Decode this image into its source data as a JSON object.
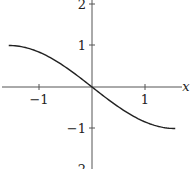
{
  "chart_data": {
    "type": "line",
    "title": "",
    "xlabel": "x",
    "ylabel": "",
    "xlim": [
      -1.75,
      1.85
    ],
    "ylim": [
      -2.0,
      2.05
    ],
    "grid": false,
    "legend": null,
    "x_ticks": [
      -1,
      1
    ],
    "x_tick_labels": [
      "−1",
      "1"
    ],
    "y_ticks": [
      2,
      1,
      -1,
      -2
    ],
    "y_tick_labels": [
      "2",
      "1",
      "−1",
      "−2"
    ],
    "series": [
      {
        "name": "y = -sin(x)",
        "x": [
          -1.5708,
          -1.2,
          -0.8,
          -0.4,
          0,
          0.4,
          0.8,
          1.2,
          1.5708
        ],
        "y": [
          1.0,
          0.932,
          0.717,
          0.389,
          0,
          -0.389,
          -0.717,
          -0.932,
          -1.0
        ]
      }
    ]
  }
}
